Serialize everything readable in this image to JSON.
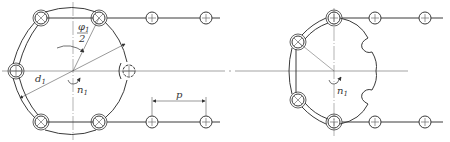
{
  "figure": {
    "colors": {
      "line": "#3a3a3a",
      "thin": "#555555",
      "background": "#ffffff"
    }
  },
  "left_sprocket": {
    "labels": {
      "pitch_diameter": "d",
      "pitch_diameter_sub": "1",
      "angle_num": "φ",
      "angle_num_sub": "1",
      "angle_den": "2",
      "speed": "n",
      "speed_sub": "1"
    },
    "rollers": [
      {
        "id": "top-left",
        "type": "x"
      },
      {
        "id": "top-right",
        "type": "x"
      },
      {
        "id": "left",
        "type": "plus"
      },
      {
        "id": "right",
        "type": "plus"
      },
      {
        "id": "bottom-left",
        "type": "x"
      },
      {
        "id": "bottom-right",
        "type": "x"
      }
    ]
  },
  "chain_segment": {
    "pitch_label": "p"
  },
  "right_sprocket": {
    "labels": {
      "speed": "n",
      "speed_sub": "1"
    },
    "rollers": [
      {
        "id": "top",
        "type": "plus"
      },
      {
        "id": "upper-left",
        "type": "x"
      },
      {
        "id": "lower-left",
        "type": "x"
      },
      {
        "id": "bottom",
        "type": "plus"
      }
    ]
  }
}
